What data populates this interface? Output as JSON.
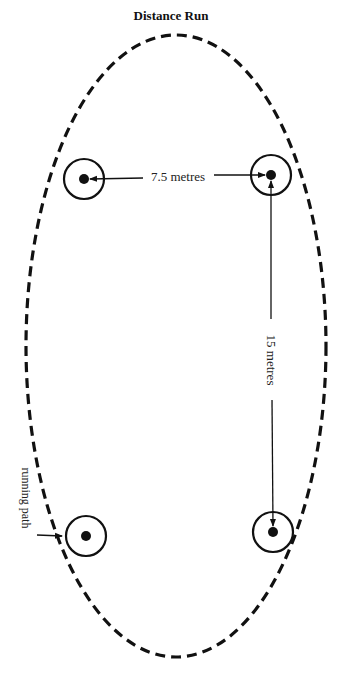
{
  "title": "Distance Run",
  "labels": {
    "horizontal_distance": "7.5 metres",
    "vertical_distance": "15 metres",
    "running_path": "running path"
  },
  "markers": [
    {
      "name": "cone-top-left"
    },
    {
      "name": "cone-top-right"
    },
    {
      "name": "cone-bottom-left"
    },
    {
      "name": "cone-bottom-right"
    }
  ],
  "colors": {
    "ink": "#111111",
    "background": "#ffffff"
  }
}
